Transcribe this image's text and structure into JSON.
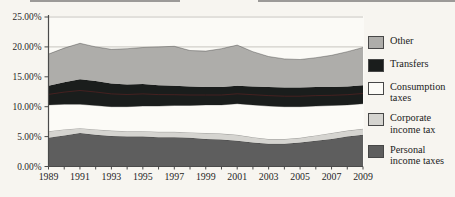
{
  "figure": {
    "kind": "scanned stacked area chart, no visible title"
  },
  "chart_data": {
    "type": "area",
    "stacked": true,
    "grid": true,
    "legend_position": "right",
    "ylim": [
      0,
      25
    ],
    "x": [
      1989,
      1990,
      1991,
      1992,
      1993,
      1994,
      1995,
      1996,
      1997,
      1998,
      1999,
      2000,
      2001,
      2002,
      2003,
      2004,
      2005,
      2006,
      2007,
      2008,
      2009
    ],
    "x_tick_labels": [
      "1989",
      "1991",
      "1993",
      "1995",
      "1997",
      "1999",
      "2001",
      "2003",
      "2005",
      "2007",
      "2009"
    ],
    "y_ticks": [
      {
        "value": 0,
        "label": "0.00%"
      },
      {
        "value": 5,
        "label": "5.00%"
      },
      {
        "value": 10,
        "label": "10.00%"
      },
      {
        "value": 15,
        "label": "15.00%"
      },
      {
        "value": 20,
        "label": "20.00%"
      },
      {
        "value": 25,
        "label": "25.00%"
      }
    ],
    "series": [
      {
        "name": "Personal income taxes",
        "color": "#5e5e5e",
        "values": [
          4.8,
          5.2,
          5.6,
          5.3,
          5.1,
          5.0,
          5.0,
          4.9,
          4.9,
          4.8,
          4.6,
          4.5,
          4.3,
          4.0,
          3.8,
          3.8,
          4.0,
          4.3,
          4.6,
          5.0,
          5.3
        ]
      },
      {
        "name": "Corporate income tax",
        "color": "#d5d4d0",
        "values": [
          1.1,
          1.0,
          0.8,
          0.9,
          0.9,
          0.9,
          0.9,
          0.9,
          0.9,
          0.9,
          1.0,
          1.0,
          1.0,
          0.9,
          0.8,
          0.8,
          0.8,
          0.9,
          1.0,
          1.0,
          1.0
        ]
      },
      {
        "name": "Consumption taxes",
        "color": "#fcfbf7",
        "values": [
          4.4,
          4.2,
          4.0,
          4.0,
          4.0,
          4.1,
          4.2,
          4.3,
          4.4,
          4.5,
          4.7,
          4.8,
          5.2,
          5.4,
          5.5,
          5.4,
          5.2,
          4.9,
          4.6,
          4.3,
          4.2
        ]
      },
      {
        "name": "Transfers",
        "color": "#1a1d1c",
        "values": [
          3.2,
          3.7,
          4.2,
          4.1,
          3.9,
          3.7,
          3.7,
          3.5,
          3.3,
          3.2,
          3.0,
          3.0,
          3.0,
          3.1,
          3.2,
          3.2,
          3.2,
          3.2,
          3.1,
          3.1,
          3.1
        ]
      },
      {
        "name": "Other",
        "color": "#aeadaa",
        "values": [
          5.3,
          5.7,
          6.0,
          5.7,
          5.7,
          6.0,
          6.1,
          6.4,
          6.6,
          6.0,
          6.0,
          6.4,
          6.8,
          5.8,
          5.1,
          4.8,
          4.7,
          4.9,
          5.3,
          5.8,
          6.3
        ]
      }
    ],
    "legend": [
      {
        "label": "Other",
        "color": "#aeadaa"
      },
      {
        "label": "Transfers",
        "color": "#1a1d1c"
      },
      {
        "label": "Consumption taxes",
        "color": "#fcfbf7"
      },
      {
        "label": "Corporate income tax",
        "color": "#d5d4d0"
      },
      {
        "label": "Personal income taxes",
        "color": "#5e5e5e"
      }
    ],
    "colors": {
      "gridline": "#c2c0ba",
      "axis": "#4a4a4a",
      "area_edge": "rgba(25,25,25,0.4)",
      "transfers_inner_artifact_line": "rgba(110,35,35,0.5)"
    }
  }
}
